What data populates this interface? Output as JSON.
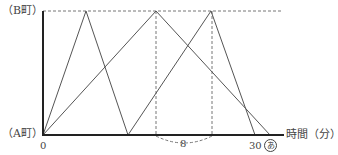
{
  "diagram": {
    "y_axis_top_label": "（B町）",
    "y_axis_bottom_label": "（A町）",
    "origin_label": "0",
    "x_axis_label": "時間（分）",
    "tick_30_label": "30",
    "unknown_label": "あ",
    "gap_label": "8"
  },
  "geometry": {
    "axis_x": 43,
    "top_y": 11,
    "base_y": 135,
    "line1_points": [
      [
        43,
        135
      ],
      [
        86,
        11
      ],
      [
        128,
        135
      ],
      [
        211,
        11
      ],
      [
        255,
        135
      ]
    ],
    "line2_points": [
      [
        43,
        135
      ],
      [
        156,
        11
      ],
      [
        270,
        135
      ]
    ],
    "dashed_verticals_x": [
      156,
      212
    ]
  },
  "colors": {
    "axis": "#222222",
    "line": "#555555",
    "dash": "#666666"
  }
}
